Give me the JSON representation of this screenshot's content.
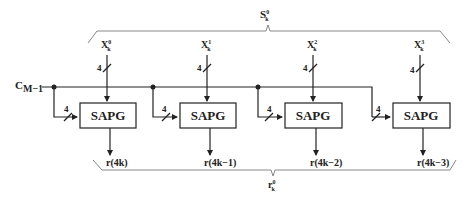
{
  "diagram": {
    "title_top": {
      "base": "S",
      "sup": "0",
      "sub": "k"
    },
    "title_bottom": {
      "base": "r",
      "sup": "0",
      "sub": "k"
    },
    "control_input": {
      "base": "C",
      "sub": "M−1"
    },
    "bus_width_label": "4",
    "blocks": [
      {
        "label": "SAPG",
        "input": {
          "base": "X",
          "sup": "0",
          "sub": "k"
        },
        "width": "4",
        "ctrl_width": "4",
        "output": "r(4k)"
      },
      {
        "label": "SAPG",
        "input": {
          "base": "X",
          "sup": "1",
          "sub": "k"
        },
        "width": "4",
        "ctrl_width": "4",
        "output": "r(4k−1)"
      },
      {
        "label": "SAPG",
        "input": {
          "base": "X",
          "sup": "2",
          "sub": "k"
        },
        "width": "4",
        "ctrl_width": "4",
        "output": "r(4k−2)"
      },
      {
        "label": "SAPG",
        "input": {
          "base": "X",
          "sup": "3",
          "sub": "k"
        },
        "width": "4",
        "ctrl_width": "4",
        "output": "r(4k−3)"
      }
    ]
  }
}
